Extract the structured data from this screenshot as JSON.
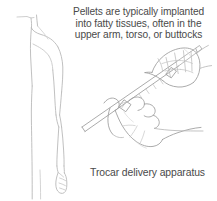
{
  "illustration": {
    "title": "Pellet implantation with trocar delivery apparatus",
    "stroke_color": "#9a9a9a",
    "stroke_color_light": "#c2c2c2",
    "background_color": "#ffffff",
    "text_color": "#4a4a4a"
  },
  "top_caption": {
    "lines": [
      "Pellets are typically implanted",
      "into fatty tissues, often in the",
      "upper arm, torso, or buttocks"
    ]
  },
  "bottom_caption": {
    "text": "Trocar delivery apparatus"
  },
  "figures": {
    "body_profile_label": "human torso and arm in profile",
    "upper_hand_label": "hand gripping trocar plunger",
    "lower_hand_label": "hand gripping trocar barrel",
    "device_label": "trocar needle and cannula"
  }
}
